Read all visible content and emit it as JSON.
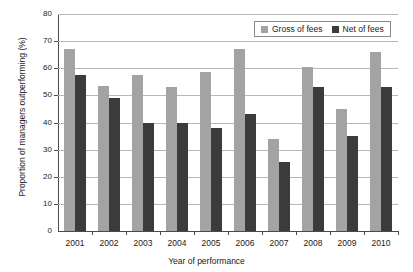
{
  "chart_data": {
    "type": "bar",
    "title": "",
    "xlabel": "Year of performance",
    "ylabel": "Proportion of managers outperforming (%)",
    "categories": [
      "2001",
      "2002",
      "2003",
      "2004",
      "2005",
      "2006",
      "2007",
      "2008",
      "2009",
      "2010"
    ],
    "series": [
      {
        "name": "Gross of fees",
        "color": "#a3a3a3",
        "values": [
          67,
          53.5,
          57.5,
          53,
          58.5,
          67,
          34,
          60.5,
          45,
          66
        ]
      },
      {
        "name": "Net of fees",
        "color": "#3b3b3b",
        "values": [
          57.5,
          49,
          40,
          40,
          38,
          43,
          25.5,
          53,
          35,
          53
        ]
      }
    ],
    "ylim": [
      0,
      80
    ],
    "yticks": [
      0,
      10,
      20,
      30,
      40,
      50,
      60,
      70,
      80
    ],
    "ytick_labels": [
      "0",
      "10",
      "20",
      "30",
      "40",
      "50",
      "60",
      "70",
      "80"
    ],
    "grid": true,
    "legend_position": "top-right"
  },
  "legend": {
    "entries": [
      {
        "label": "Gross of fees",
        "swatch_color": "#a3a3a3"
      },
      {
        "label": "Net of fees",
        "swatch_color": "#3b3b3b"
      }
    ]
  },
  "colors": {
    "gross_of_fees": "#a3a3a3",
    "net_of_fees": "#3b3b3b",
    "gridline": "#b9b9b9",
    "axis": "#4a4a4a",
    "background": "#ffffff",
    "text": "#1a1a1a"
  }
}
